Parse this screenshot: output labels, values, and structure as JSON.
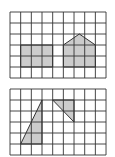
{
  "figures": [
    {
      "name": "top-grid",
      "cols": 9,
      "rows": 6,
      "origin": [
        10,
        12
      ],
      "cell_w": 10.67,
      "cell_h": 11,
      "shapes": [
        {
          "name": "rectangle",
          "points": [
            [
              1,
              3
            ],
            [
              4,
              3
            ],
            [
              4,
              5
            ],
            [
              1,
              5
            ]
          ]
        },
        {
          "name": "pentagon-house",
          "points": [
            [
              5,
              5
            ],
            [
              8,
              5
            ],
            [
              8,
              3
            ],
            [
              6.5,
              2
            ],
            [
              5,
              3
            ]
          ]
        }
      ]
    },
    {
      "name": "bottom-grid",
      "cols": 9,
      "rows": 6,
      "origin": [
        10,
        89
      ],
      "cell_w": 10.67,
      "cell_h": 11,
      "shapes": [
        {
          "name": "tall-triangle",
          "points": [
            [
              1,
              5
            ],
            [
              3,
              1
            ],
            [
              3,
              5
            ]
          ]
        },
        {
          "name": "small-triangle",
          "points": [
            [
              4,
              1
            ],
            [
              6,
              1
            ],
            [
              6,
              3
            ]
          ]
        }
      ]
    }
  ],
  "colors": {
    "grid": "#333333",
    "fill": "#cccccc",
    "background": "#ffffff"
  }
}
